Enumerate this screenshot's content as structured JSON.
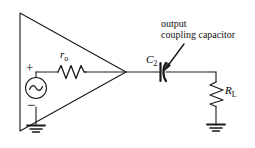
{
  "diagram": {
    "background_color": "#ffffff",
    "line_color": "#1a1a1a",
    "annotation": {
      "line1": "output",
      "line2": "coupling capacitor",
      "points_to": "C2"
    },
    "components": [
      {
        "id": "amplifier",
        "name": "amplifier-triangle",
        "label": ""
      },
      {
        "id": "source",
        "name": "ac-voltage-source",
        "symbol": "sine-wave",
        "plus_sign": "+",
        "minus_sign": "−"
      },
      {
        "id": "ro",
        "name": "output-resistance",
        "label": "r",
        "subscript": "o"
      },
      {
        "id": "c2",
        "name": "coupling-capacitor",
        "label": "C",
        "subscript": "2"
      },
      {
        "id": "rl",
        "name": "load-resistor",
        "label": "R",
        "subscript": "L"
      },
      {
        "id": "gnd-left",
        "name": "ground-source",
        "label": ""
      },
      {
        "id": "gnd-right",
        "name": "ground-load",
        "label": ""
      }
    ]
  }
}
